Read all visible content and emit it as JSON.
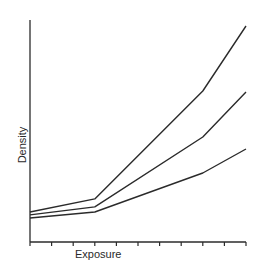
{
  "chart_data": {
    "type": "line",
    "title": "",
    "xlabel": "Exposure",
    "ylabel": "Density",
    "x_ticks": 11,
    "x_tick_labels": [],
    "y_tick_labels": [],
    "grid": false,
    "legend": null,
    "xlim": [
      0,
      10
    ],
    "ylim": [
      0,
      100
    ],
    "x": [
      0,
      3,
      8,
      10
    ],
    "series": [
      {
        "name": "curve-top",
        "values": [
          13.5,
          19.4,
          68.0,
          97.3
        ]
      },
      {
        "name": "curve-middle",
        "values": [
          12.2,
          15.8,
          47.3,
          67.6
        ]
      },
      {
        "name": "curve-bottom",
        "values": [
          10.8,
          13.5,
          31.1,
          41.9
        ]
      }
    ],
    "line_color": "#2b2b2b",
    "axis_color": "#2b2b2b"
  }
}
